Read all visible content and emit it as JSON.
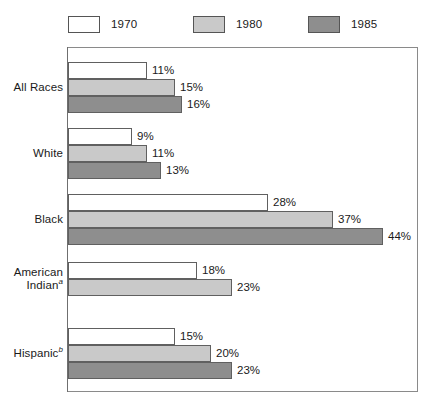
{
  "legend": {
    "position": "top",
    "entries": [
      {
        "label": "1970",
        "swatch": "white-swatch",
        "color": "#ffffff"
      },
      {
        "label": "1980",
        "swatch": "light-gray-swatch",
        "color": "#c9c9c9"
      },
      {
        "label": "1985",
        "swatch": "dark-gray-swatch",
        "color": "#8e8e8e"
      }
    ]
  },
  "groups": [
    {
      "label": "All Races",
      "footnote": "",
      "bars": [
        {
          "series": "1970",
          "value": 11,
          "value_label": "11%"
        },
        {
          "series": "1980",
          "value": 15,
          "value_label": "15%"
        },
        {
          "series": "1985",
          "value": 16,
          "value_label": "16%"
        }
      ]
    },
    {
      "label": "White",
      "footnote": "",
      "bars": [
        {
          "series": "1970",
          "value": 9,
          "value_label": "9%"
        },
        {
          "series": "1980",
          "value": 11,
          "value_label": "11%"
        },
        {
          "series": "1985",
          "value": 13,
          "value_label": "13%"
        }
      ]
    },
    {
      "label": "Black",
      "footnote": "",
      "bars": [
        {
          "series": "1970",
          "value": 28,
          "value_label": "28%"
        },
        {
          "series": "1980",
          "value": 37,
          "value_label": "37%"
        },
        {
          "series": "1985",
          "value": 44,
          "value_label": "44%"
        }
      ]
    },
    {
      "label": "American Indian",
      "footnote": "a",
      "bars": [
        {
          "series": "1970",
          "value": 18,
          "value_label": "18%"
        },
        {
          "series": "1980",
          "value": 23,
          "value_label": "23%"
        }
      ]
    },
    {
      "label": "Hispanic",
      "footnote": "b",
      "bars": [
        {
          "series": "1970",
          "value": 15,
          "value_label": "15%"
        },
        {
          "series": "1980",
          "value": 20,
          "value_label": "20%"
        },
        {
          "series": "1985",
          "value": 23,
          "value_label": "23%"
        }
      ]
    }
  ],
  "chart_data": {
    "type": "bar",
    "orientation": "horizontal",
    "title": "",
    "subtitle": "",
    "xlabel": "",
    "ylabel": "",
    "categories": [
      "All Races",
      "White",
      "Black",
      "American Indianᵃ",
      "Hispanicᵇ"
    ],
    "series": [
      {
        "name": "1970",
        "color": "#ffffff",
        "values": [
          11,
          9,
          28,
          18,
          15
        ]
      },
      {
        "name": "1980",
        "color": "#c9c9c9",
        "values": [
          15,
          11,
          37,
          23,
          20
        ]
      },
      {
        "name": "1985",
        "color": "#8e8e8e",
        "values": [
          16,
          13,
          44,
          null,
          23
        ]
      }
    ],
    "value_labels": [
      [
        "11%",
        "15%",
        "16%"
      ],
      [
        "9%",
        "11%",
        "13%"
      ],
      [
        "28%",
        "37%",
        "44%"
      ],
      [
        "18%",
        "23%"
      ],
      [
        "15%",
        "20%",
        "23%"
      ]
    ],
    "units": "percent",
    "xlim": [
      0,
      48
    ],
    "grid": false,
    "legend_position": "top",
    "footnotes": [
      "a",
      "b"
    ]
  },
  "render": {
    "plot_left_px": 68,
    "plot_right_px": 418,
    "px_per_percent": 7.15,
    "bar_height_px": 17,
    "group_tops_px": [
      62,
      128,
      194,
      262,
      328
    ]
  }
}
